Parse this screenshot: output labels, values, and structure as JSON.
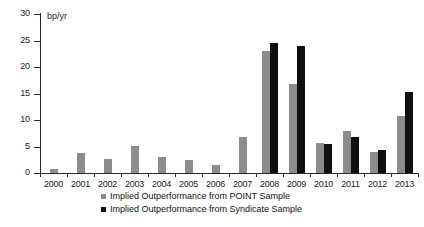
{
  "chart_data": {
    "type": "bar",
    "title": "",
    "subtitle": "",
    "xlabel": "",
    "ylabel": "bp/yr",
    "unit_label": "bp/yr",
    "ylim": [
      0,
      30
    ],
    "yticks": [
      0,
      5,
      10,
      15,
      20,
      25,
      30
    ],
    "ytick_labels": [
      "0",
      "5",
      "10",
      "15",
      "20",
      "25",
      "30"
    ],
    "grid": false,
    "legend_position": "bottom-center",
    "categories": [
      "2000",
      "2001",
      "2002",
      "2003",
      "2004",
      "2005",
      "2006",
      "2007",
      "2008",
      "2009",
      "2010",
      "2011",
      "2012",
      "2013"
    ],
    "series": [
      {
        "name": "Implied Outperformance from POINT Sample",
        "color": "#8c8c8c",
        "values": [
          0.7,
          3.7,
          2.6,
          5.1,
          3.1,
          2.4,
          1.6,
          6.8,
          23.0,
          16.8,
          5.7,
          8.0,
          4.0,
          10.7
        ]
      },
      {
        "name": "Implied Outperformance from Syndicate Sample",
        "color": "#101010",
        "values": [
          null,
          null,
          null,
          null,
          null,
          null,
          null,
          null,
          24.6,
          24.0,
          5.5,
          6.8,
          4.3,
          15.2
        ]
      }
    ]
  },
  "legend": {
    "items": [
      {
        "label": "Implied Outperformance from POINT Sample",
        "swatch": "point"
      },
      {
        "label": "Implied Outperformance from Syndicate Sample",
        "swatch": "syndicate"
      }
    ]
  }
}
